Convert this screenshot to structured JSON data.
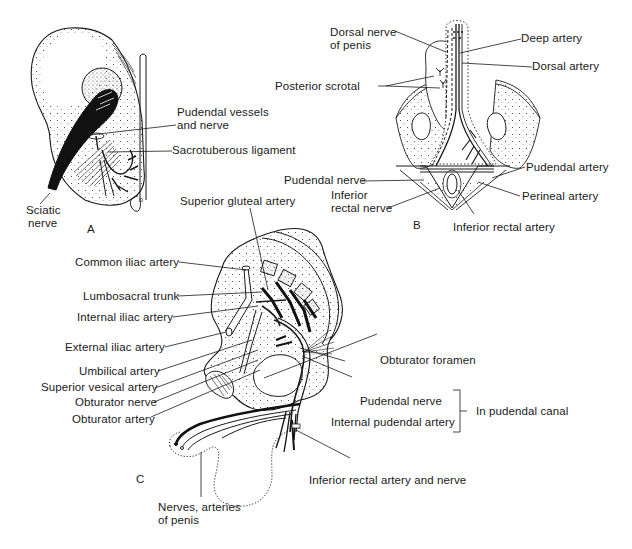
{
  "panels": {
    "A": {
      "letter": "A",
      "labels": {
        "sciatic_line1": "Sciatic",
        "sciatic_line2": "nerve",
        "pudendal_vessels_line1": "Pudendal vessels",
        "pudendal_vessels_line2": "and nerve",
        "sacrotuberous": "Sacrotuberous ligament"
      }
    },
    "B": {
      "letter": "B",
      "labels": {
        "dorsal_nerve_line1": "Dorsal nerve",
        "dorsal_nerve_line2": "of penis",
        "deep_artery": "Deep artery",
        "dorsal_artery": "Dorsal artery",
        "posterior_scrotal": "Posterior scrotal",
        "pudendal_nerve": "Pudendal nerve",
        "pudendal_artery": "Pudendal artery",
        "inferior_rectal_nerve_line1": "Inferior",
        "inferior_rectal_nerve_line2": "rectal nerve",
        "perineal_artery": "Perineal artery",
        "inferior_rectal_artery": "Inferior rectal artery"
      }
    },
    "C": {
      "letter": "C",
      "labels": {
        "superior_gluteal": "Superior gluteal artery",
        "common_iliac": "Common iliac artery",
        "lumbosacral": "Lumbosacral trunk",
        "internal_iliac": "Internal iliac artery",
        "external_iliac": "External iliac artery",
        "umbilical": "Umbilical artery",
        "superior_vesical": "Superior vesical artery",
        "obturator_nerve": "Obturator nerve",
        "obturator_artery": "Obturator artery",
        "obturator_foramen": "Obturator foramen",
        "pudendal_nerve": "Pudendal nerve",
        "internal_pudendal": "Internal pudendal artery",
        "in_pudendal_canal": "In pudendal canal",
        "inferior_rectal_artery_nerve": "Inferior rectal artery and nerve",
        "nerves_arteries_line1": "Nerves, arteries",
        "nerves_arteries_line2": "of penis"
      }
    }
  }
}
